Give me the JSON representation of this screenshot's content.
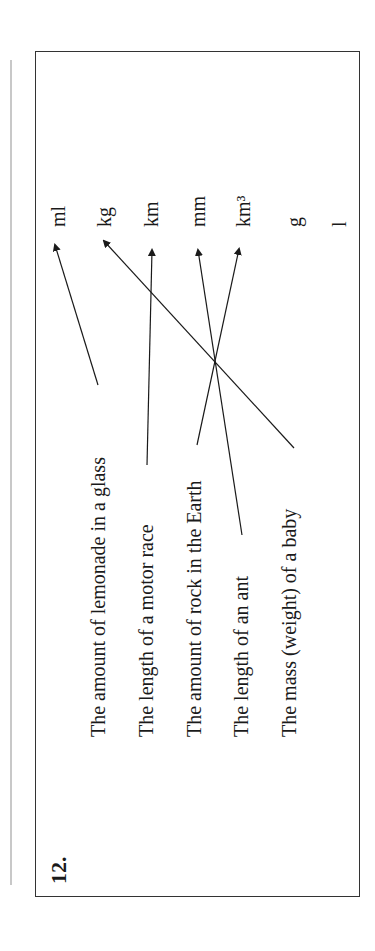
{
  "question": {
    "number": "12.",
    "items": [
      "The amount of lemonade in a glass",
      "The length of a motor race",
      "The amount of rock in the Earth",
      "The length of an ant",
      "The mass (weight) of a baby"
    ],
    "units": [
      "ml",
      "kg",
      "km",
      "mm",
      "km³",
      "g",
      "l"
    ],
    "matches": [
      {
        "item": "The amount of lemonade in a glass",
        "unit": "ml"
      },
      {
        "item": "The length of a motor race",
        "unit": "km"
      },
      {
        "item": "The amount of rock in the Earth",
        "unit": "km³"
      },
      {
        "item": "The length of an ant",
        "unit": "mm"
      },
      {
        "item": "The mass (weight) of a baby",
        "unit": "kg"
      }
    ]
  }
}
